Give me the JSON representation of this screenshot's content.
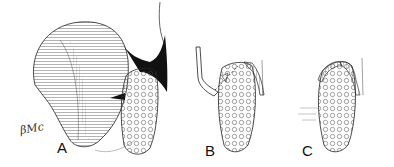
{
  "figure": {
    "panels": [
      {
        "id": "A",
        "label": "A"
      },
      {
        "id": "B",
        "label": "B"
      },
      {
        "id": "C",
        "label": "C"
      }
    ],
    "signature": "βMc",
    "colors": {
      "ink": "#111111",
      "background": "#ffffff"
    }
  }
}
